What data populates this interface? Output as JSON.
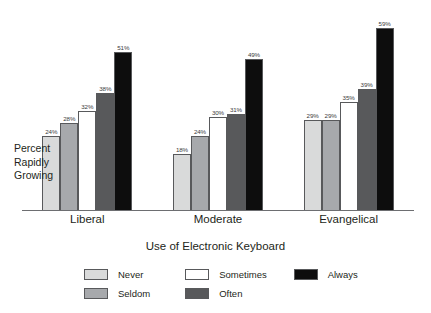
{
  "chart_data": {
    "type": "bar",
    "title": "",
    "xlabel": "Use of Electronic Keyboard",
    "ylabel": "Percent Rapidly Growing",
    "ylabel_lines": [
      "Percent",
      "Rapidly",
      "Growing"
    ],
    "categories": [
      "Liberal",
      "Moderate",
      "Evangelical"
    ],
    "series": [
      {
        "name": "Never",
        "values": [
          24,
          18,
          29
        ],
        "color": "#d9dada"
      },
      {
        "name": "Seldom",
        "values": [
          28,
          24,
          29
        ],
        "color": "#a7a9ac"
      },
      {
        "name": "Sometimes",
        "values": [
          32,
          30,
          35
        ],
        "color": "#ffffff"
      },
      {
        "name": "Often",
        "values": [
          38,
          31,
          39
        ],
        "color": "#58595b"
      },
      {
        "name": "Always",
        "values": [
          51,
          49,
          59
        ],
        "color": "#0d0d0d"
      }
    ],
    "value_suffix": "%",
    "ylim": [
      0,
      66
    ],
    "grid": false,
    "legend_position": "bottom",
    "axis_line_color": "#6d6e71",
    "bar_border_color": "#58595b",
    "label_color": "#3b3b3d"
  },
  "legend": {
    "rows": [
      [
        {
          "label": "Never",
          "swatch": "#d9dada"
        },
        {
          "label": "Sometimes",
          "swatch": "#ffffff"
        },
        {
          "label": "Always",
          "swatch": "#0d0d0d"
        }
      ],
      [
        {
          "label": "Seldom",
          "swatch": "#a7a9ac"
        },
        {
          "label": "Often",
          "swatch": "#58595b"
        }
      ]
    ]
  },
  "bar_labels": {
    "liberal": [
      "24%",
      "28%",
      "32%",
      "38%",
      "51%"
    ],
    "moderate": [
      "18%",
      "24%",
      "30%",
      "31%",
      "49%"
    ],
    "evangelical": [
      "29%",
      "29%",
      "35%",
      "39%",
      "59%"
    ]
  }
}
